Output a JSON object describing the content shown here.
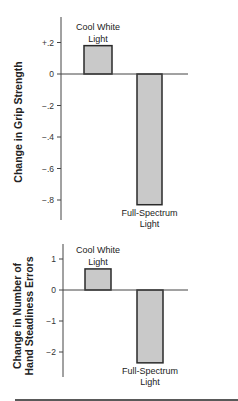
{
  "chart_data": [
    {
      "type": "bar",
      "title": "",
      "xlabel": "",
      "ylabel": "Change in Grip Strength",
      "categories": [
        "Cool White Light",
        "Full-Spectrum Light"
      ],
      "category_lines": [
        [
          "Cool White",
          "Light"
        ],
        [
          "Full-Spectrum",
          "Light"
        ]
      ],
      "values": [
        0.18,
        -0.83
      ],
      "ylim": [
        -0.95,
        0.33
      ],
      "yticks": [
        0.2,
        0,
        -0.2,
        -0.4,
        -0.6,
        -0.8
      ],
      "ytick_labels": [
        "+.2",
        "0",
        "-.2",
        "-.4",
        "-.6",
        "-.8"
      ],
      "grid": false,
      "legend": "none"
    },
    {
      "type": "bar",
      "title": "",
      "xlabel": "",
      "ylabel": "Change in Number of Hand Steadiness Errors",
      "ylabel_lines": [
        "Change in Number of",
        "Hand Steadiness Errors"
      ],
      "categories": [
        "Cool White Light",
        "Full-Spectrum Light"
      ],
      "category_lines": [
        [
          "Cool White",
          "Light"
        ],
        [
          "Full-Spectrum",
          "Light"
        ]
      ],
      "values": [
        0.68,
        -2.35
      ],
      "ylim": [
        -2.8,
        1.5
      ],
      "yticks": [
        1,
        0,
        -1,
        -2
      ],
      "ytick_labels": [
        "1",
        "0",
        "-1",
        "-2"
      ],
      "grid": false,
      "legend": "none"
    }
  ],
  "style": {
    "bar_fill": "#c9c9c9",
    "bar_stroke": "#2a2a2a",
    "axis_color": "#444444"
  }
}
